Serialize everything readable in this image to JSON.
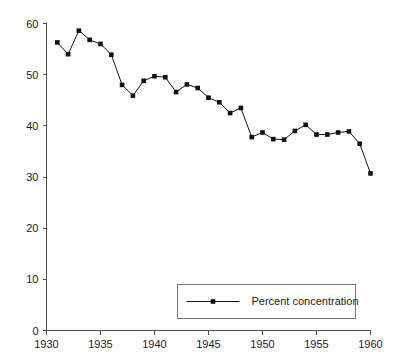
{
  "chart_data": {
    "type": "line",
    "title": "",
    "subtitle": "",
    "xlabel": "",
    "ylabel": "",
    "xlim": [
      1930,
      1960
    ],
    "ylim": [
      0,
      60
    ],
    "grid": false,
    "legend_position": "bottom-center",
    "x_ticks": [
      1930,
      1935,
      1940,
      1945,
      1950,
      1955,
      1960
    ],
    "x_tick_labels": [
      "1930",
      "1935",
      "1940",
      "1945",
      "1950",
      "1955",
      "1960"
    ],
    "y_ticks": [
      0,
      10,
      20,
      30,
      40,
      50,
      60
    ],
    "y_tick_labels": [
      "0",
      "10",
      "20",
      "30",
      "40",
      "50",
      "60"
    ],
    "x": [
      1931,
      1932,
      1933,
      1934,
      1935,
      1936,
      1937,
      1938,
      1939,
      1940,
      1941,
      1942,
      1943,
      1944,
      1945,
      1946,
      1947,
      1948,
      1949,
      1950,
      1951,
      1952,
      1953,
      1954,
      1955,
      1956,
      1957,
      1958,
      1959,
      1960
    ],
    "series": [
      {
        "name": "Percent concentration",
        "marker": "square",
        "color": "#111111",
        "values": [
          56.3,
          54.0,
          58.6,
          56.8,
          56.0,
          53.9,
          48.0,
          45.9,
          48.8,
          49.7,
          49.5,
          46.6,
          48.1,
          47.4,
          45.5,
          44.6,
          42.5,
          43.5,
          37.8,
          38.7,
          37.4,
          37.3,
          39.0,
          40.2,
          38.3,
          38.3,
          38.7,
          38.9,
          36.5,
          30.7
        ]
      }
    ],
    "legend": [
      {
        "label": "Percent concentration"
      }
    ],
    "annotations": []
  },
  "colors": {
    "series": "#111111",
    "axis": "#4d4d4d",
    "legend_border": "#777777",
    "background": "#ffffff",
    "text": "#1a1a1a"
  }
}
